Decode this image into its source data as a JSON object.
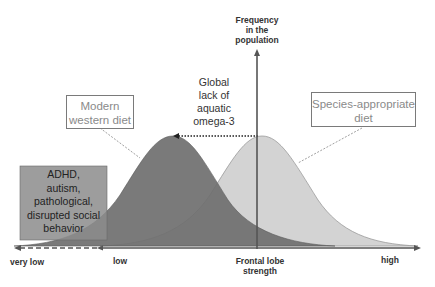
{
  "diagram": {
    "y_axis_label": [
      "Frequency",
      "in the",
      "population"
    ],
    "x_axis_label": [
      "Frontal lobe",
      "strength"
    ],
    "x_ticks": {
      "very_low": "very low",
      "low": "low",
      "high": "high"
    },
    "shift_annotation": [
      "Global",
      "lack of",
      "aquatic",
      "omega-3"
    ],
    "modern_box": [
      "Modern",
      "western diet"
    ],
    "species_box": [
      "Species-appropriate",
      "diet"
    ],
    "pathology_box": [
      "ADHD,",
      "autism,",
      "pathological,",
      "disrupted social",
      "behavior"
    ],
    "colors": {
      "modern_curve": "#6e6e6e",
      "species_curve": "#d2d2d2",
      "pathology_box": "#8a8a8a",
      "axis": "#555555",
      "box_text": "#8a8a8a"
    }
  }
}
